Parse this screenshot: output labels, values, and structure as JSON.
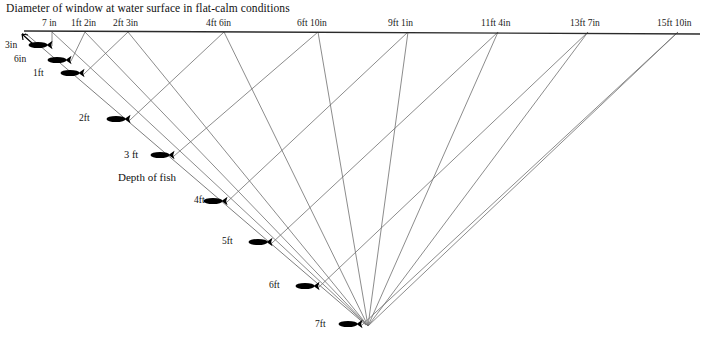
{
  "chart_data": {
    "type": "diagram",
    "title": "Diameter of window at water surface in flat-calm conditions",
    "xlabel": "",
    "ylabel": "Depth of fish",
    "grid": false,
    "legend": "none",
    "surface_line": {
      "x_start": 24,
      "x_end": 700,
      "y_start": 31,
      "y_end": 34
    },
    "apex": {
      "x": 366,
      "y": 325,
      "depth": "7ft"
    },
    "categories": [
      "3in",
      "6in",
      "1ft",
      "2ft",
      "3 ft",
      "4ft",
      "5ft",
      "6ft",
      "7ft"
    ],
    "values": [
      "7 in",
      "1ft 2in",
      "2ft 3in",
      "4ft 6in",
      "6ft 10in",
      "9ft 1in",
      "11ft 4in",
      "13ft 7in",
      "15ft 10in"
    ],
    "points": [
      {
        "depth": "3in",
        "diameter": "7 in",
        "fish_x": 38,
        "fish_y": 45,
        "label_x": 5,
        "label_y": 41,
        "surface_x": 52,
        "label_size": "small"
      },
      {
        "depth": "6in",
        "diameter": "1ft 2in",
        "fish_x": 57,
        "fish_y": 60,
        "label_x": 14,
        "label_y": 55,
        "surface_x": 85,
        "label_size": "small"
      },
      {
        "depth": "1ft",
        "diameter": "2ft 3in",
        "fish_x": 70,
        "fish_y": 73,
        "label_x": 33,
        "label_y": 69,
        "surface_x": 128,
        "label_size": "small"
      },
      {
        "depth": "2ft",
        "diameter": "4ft 6in",
        "fish_x": 116,
        "fish_y": 119,
        "label_x": 79,
        "label_y": 114,
        "surface_x": 224,
        "label_size": "small"
      },
      {
        "depth": "3 ft",
        "diameter": "6ft 10in",
        "fish_x": 160,
        "fish_y": 155,
        "label_x": 124,
        "label_y": 150,
        "surface_x": 318,
        "label_size": "big"
      },
      {
        "depth": "4ft",
        "diameter": "9ft 1in",
        "fish_x": 213,
        "fish_y": 201,
        "label_x": 194,
        "label_y": 196,
        "surface_x": 408,
        "label_size": "small"
      },
      {
        "depth": "5ft",
        "diameter": "11ft 4in",
        "fish_x": 258,
        "fish_y": 242,
        "label_x": 222,
        "label_y": 237,
        "surface_x": 498,
        "label_size": "small"
      },
      {
        "depth": "6ft",
        "diameter": "13ft 7in",
        "fish_x": 305,
        "fish_y": 286,
        "label_x": 269,
        "label_y": 281,
        "surface_x": 588,
        "label_size": "small"
      },
      {
        "depth": "7ft",
        "diameter": "15ft 10in",
        "fish_x": 348,
        "fish_y": 324,
        "label_x": 315,
        "label_y": 320,
        "surface_x": 678,
        "label_size": "small"
      }
    ],
    "surface_labels": [
      {
        "text": "7 in",
        "x": 42
      },
      {
        "text": "1ft 2in",
        "x": 71
      },
      {
        "text": "2ft 3in",
        "x": 113
      },
      {
        "text": "4ft 6in",
        "x": 206
      },
      {
        "text": "6ft 10in",
        "x": 297
      },
      {
        "text": "9ft 1in",
        "x": 388
      },
      {
        "text": "11ft 4in",
        "x": 481
      },
      {
        "text": "13ft 7in",
        "x": 570
      },
      {
        "text": "15ft 10in",
        "x": 657
      }
    ],
    "depth_axis_caption": "Depth of fish"
  },
  "colors": {
    "line": "#6f6f6f",
    "surface_line": "#2b2b2b",
    "fish": "#000000",
    "text": "#111111",
    "background": "#ffffff"
  },
  "icons": {
    "fish": "fish-icon",
    "arrow": "arrow-icon"
  },
  "bottom_caption": ""
}
